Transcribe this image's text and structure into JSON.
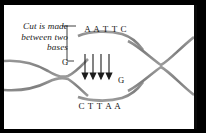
{
  "figure": {
    "background_color": "#ffffff",
    "frame_color": "#000000"
  },
  "caption": {
    "lines": [
      "Cut is made",
      "between two",
      "bases"
    ],
    "line1": "Cut is made",
    "line2": "between two",
    "line3": "bases",
    "style": "italic-serif",
    "color": "#1a1a1a"
  },
  "sequence": {
    "top_strand_label": "A A T T C",
    "top_bases": [
      "A",
      "A",
      "T",
      "T",
      "C"
    ],
    "bottom_strand_label": "C T T A A",
    "bottom_bases": [
      "C",
      "T",
      "T",
      "A",
      "A"
    ],
    "left_cut_base": "G",
    "right_cut_base": "G"
  },
  "annotations": {
    "arrow_count": 4,
    "arrow_direction": "down",
    "leader_line": "bracket-to-cut-site",
    "arrow_color": "#1a1a1a"
  },
  "colors": {
    "strand_dark": "#8a8a8a",
    "strand_mid": "#a8a8a8",
    "rung_light": "#c9c9c9",
    "text": "#141414",
    "frame": "#000000",
    "paper": "#ffffff"
  }
}
